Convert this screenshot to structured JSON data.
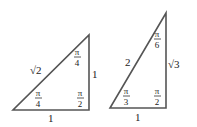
{
  "diagram": {
    "stroke_color": "#555555",
    "triangles": [
      {
        "name": "45-45-90 triangle",
        "hypotenuse": "√2",
        "vertical_leg": "1",
        "base": "1",
        "angles": {
          "top": {
            "num": "π",
            "den": "4"
          },
          "bottom_left": {
            "num": "π",
            "den": "4"
          },
          "right_angle": {
            "num": "π",
            "den": "2"
          }
        }
      },
      {
        "name": "30-60-90 triangle",
        "hypotenuse": "2",
        "vertical_leg": "√3",
        "base": "1",
        "angles": {
          "top": {
            "num": "π",
            "den": "6"
          },
          "bottom_left": {
            "num": "π",
            "den": "3"
          },
          "right_angle": {
            "num": "π",
            "den": "2"
          }
        }
      }
    ]
  }
}
